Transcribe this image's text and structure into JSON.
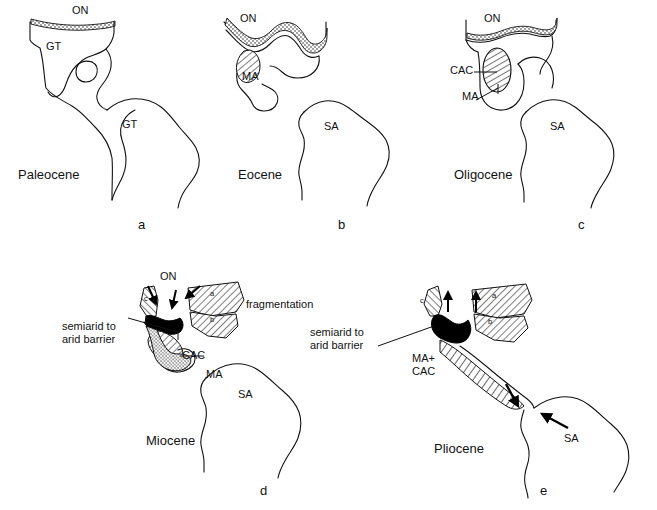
{
  "figure": {
    "type": "paleogeographic-map-series",
    "background": "#ffffff",
    "ink": "#000000"
  },
  "panels": [
    {
      "key": "a",
      "letter": "a",
      "epoch": "Paleocene",
      "labels": [
        {
          "name": "on",
          "text": "ON"
        },
        {
          "name": "gt-north",
          "text": "GT"
        },
        {
          "name": "gt-south",
          "text": "GT"
        }
      ]
    },
    {
      "key": "b",
      "letter": "b",
      "epoch": "Eocene",
      "labels": [
        {
          "name": "on",
          "text": "ON"
        },
        {
          "name": "ma",
          "text": "MA"
        },
        {
          "name": "sa",
          "text": "SA"
        }
      ]
    },
    {
      "key": "c",
      "letter": "c",
      "epoch": "Oligocene",
      "labels": [
        {
          "name": "on",
          "text": "ON"
        },
        {
          "name": "cac",
          "text": "CAC"
        },
        {
          "name": "ma",
          "text": "MA"
        },
        {
          "name": "sa",
          "text": "SA"
        }
      ]
    },
    {
      "key": "d",
      "letter": "d",
      "epoch": "Miocene",
      "labels": [
        {
          "name": "on",
          "text": "ON"
        },
        {
          "name": "cac",
          "text": "CAC"
        },
        {
          "name": "ma",
          "text": "MA"
        },
        {
          "name": "sa",
          "text": "SA"
        },
        {
          "name": "fragmentation",
          "text": "fragmentation"
        },
        {
          "name": "barrier",
          "text": "semiarid to\narid barrier"
        },
        {
          "name": "block-a",
          "text": "a"
        },
        {
          "name": "block-b",
          "text": "b"
        },
        {
          "name": "block-c",
          "text": "c"
        }
      ]
    },
    {
      "key": "e",
      "letter": "e",
      "epoch": "Pliocene",
      "labels": [
        {
          "name": "ma-cac",
          "text": "MA+\nCAC"
        },
        {
          "name": "sa",
          "text": "SA"
        },
        {
          "name": "barrier",
          "text": "semiarid to\narid barrier"
        },
        {
          "name": "block-a",
          "text": "a"
        },
        {
          "name": "block-b",
          "text": "b"
        },
        {
          "name": "block-c",
          "text": "c"
        }
      ]
    }
  ],
  "legend_terms": {
    "ON": "ON",
    "GT": "GT",
    "MA": "MA",
    "CAC": "CAC",
    "SA": "SA"
  }
}
